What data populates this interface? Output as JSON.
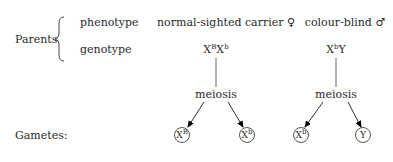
{
  "parents": {
    "label": "Parents",
    "phenotype_label": "phenotype",
    "genotype_label": "genotype",
    "mother": {
      "phenotype": "normal-sighted carrier ♀",
      "genotype": {
        "a": "X",
        "a_sup": "B",
        "b": "X",
        "b_sup": "b"
      }
    },
    "father": {
      "phenotype": "colour-blind ♂",
      "genotype": {
        "a": "X",
        "a_sup": "b",
        "b": "Y"
      }
    }
  },
  "process": {
    "left": "meiosis",
    "right": "meiosis"
  },
  "gametes": {
    "label": "Gametes:",
    "items": [
      {
        "base": "X",
        "sup": "B"
      },
      {
        "base": "X",
        "sup": "b"
      },
      {
        "base": "X",
        "sup": "b"
      },
      {
        "base": "Y",
        "sup": ""
      }
    ]
  },
  "colors": {
    "ink": "#2a2a2a",
    "line": "#555555",
    "arrow": "#000000"
  }
}
